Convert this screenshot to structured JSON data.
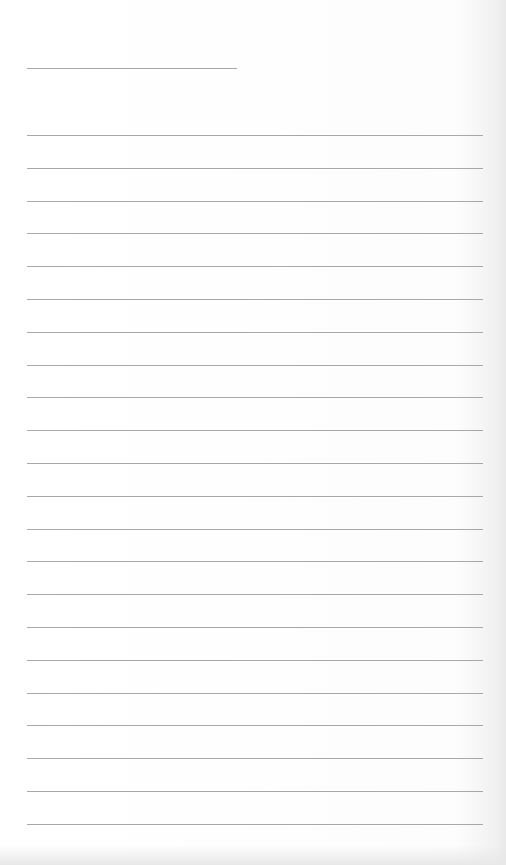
{
  "document": {
    "type": "lined-paper",
    "background_color": "#fdfdfd",
    "line_color": "#8c8c8c",
    "header_line": {
      "left": 27,
      "right": 237,
      "y": 68
    },
    "lines": {
      "left": 27,
      "right": 483,
      "first_y": 135,
      "spacing": 32.8,
      "count": 22
    }
  }
}
